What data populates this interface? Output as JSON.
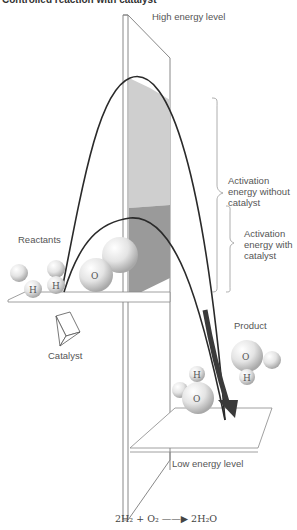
{
  "header": {
    "clipped_title": "Controlled reaction with catalyst"
  },
  "labels": {
    "high_energy": "High energy level",
    "low_energy": "Low energy level",
    "reactants": "Reactants",
    "product": "Product",
    "catalyst": "Catalyst",
    "activation_without": [
      "Activation",
      "energy without",
      "catalyst"
    ],
    "activation_with": [
      "Activation",
      "energy with",
      "catalyst"
    ]
  },
  "atoms": {
    "reactants": [
      "H",
      "H",
      "O"
    ],
    "product": [
      "H",
      "O",
      "O",
      "H"
    ]
  },
  "equation": {
    "left": "2H₂ + O₂",
    "arrow": "——▶",
    "right": "2H₂O"
  },
  "colors": {
    "curve": "#2a2a2a",
    "arrow": "#3a3a3a",
    "shade_light": "#cfcfcf",
    "shade_dark": "#9a9a9a",
    "panel_line": "#888888"
  }
}
